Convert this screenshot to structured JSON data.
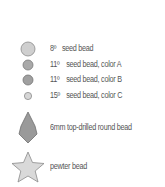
{
  "legend": {
    "items": [
      {
        "size": "8º",
        "text": "seed bead",
        "shape": "circle-large",
        "fill": "#cfcfcf"
      },
      {
        "size": "11º",
        "text": "seed bead, color A",
        "shape": "circle-medium",
        "fill": "#a9a9a9"
      },
      {
        "size": "11º",
        "text": "seed bead, color B",
        "shape": "circle-medium",
        "fill": "#a0a0a0"
      },
      {
        "size": "15º",
        "text": "seed bead, color C",
        "shape": "circle-small",
        "fill": "#d6d6d6"
      },
      {
        "size": "",
        "text": "6mm top-drilled round bead",
        "shape": "teardrop",
        "fill": "#9a9a9a"
      },
      {
        "size": "",
        "text": "pewter bead",
        "shape": "star",
        "fill": "#d9d9d9"
      }
    ]
  }
}
